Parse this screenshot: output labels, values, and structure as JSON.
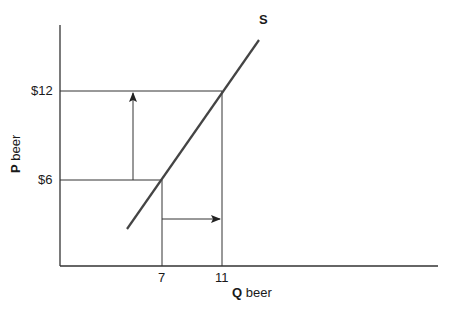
{
  "diagram": {
    "type": "supply-curve",
    "curve_label": "S",
    "y_axis": {
      "var": "P",
      "label": "beer",
      "ticks": [
        "$12",
        "$6"
      ]
    },
    "x_axis": {
      "var": "Q",
      "label": "beer",
      "ticks": [
        "7",
        "11"
      ]
    },
    "points": [
      {
        "price": "$6",
        "quantity": "7"
      },
      {
        "price": "$12",
        "quantity": "11"
      }
    ],
    "arrows": [
      {
        "direction": "up",
        "meaning": "price rises from $6 to $12"
      },
      {
        "direction": "right",
        "meaning": "quantity supplied rises from 7 to 11"
      }
    ],
    "line_color": "#333333"
  }
}
